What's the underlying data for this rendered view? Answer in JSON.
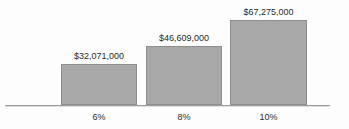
{
  "chart_data": {
    "type": "bar",
    "title": "",
    "title_note": "title cropped off at top edge of image, not legible",
    "xlabel": "",
    "ylabel": "",
    "categories": [
      "6%",
      "8%",
      "10%"
    ],
    "values": [
      32071000,
      46609000,
      67275000
    ],
    "data_labels": [
      "$32,071,000",
      "$46,609,000",
      "$67,275,000"
    ],
    "ylim": [
      0,
      78000000
    ],
    "grid": false,
    "legend": false,
    "bar_color": "#a8a8a8",
    "bar_border_color": "#8e8e8e",
    "axis_color": "#9a9a9a",
    "background_color": "#fdfdfd",
    "text_color": "#2b2b2b"
  }
}
